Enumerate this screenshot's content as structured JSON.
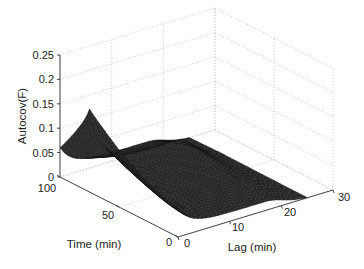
{
  "chart_data": {
    "type": "surface3d",
    "title": "",
    "xlabel": "Lag (min)",
    "ylabel": "Time (min)",
    "zlabel": "Autocov(F)",
    "x_ticks": [
      0,
      10,
      20,
      30
    ],
    "y_ticks": [
      0,
      50,
      100
    ],
    "z_ticks": [
      0,
      0.05,
      0.1,
      0.15,
      0.2,
      0.25
    ],
    "z_tick_labels": [
      "0",
      "0.05",
      "0.1",
      "0.15",
      "0.2",
      "0.25"
    ],
    "xlim": [
      0,
      30
    ],
    "ylim": [
      0,
      100
    ],
    "zlim": [
      0,
      0.25
    ],
    "grid": true,
    "surface_extent": {
      "lag_max": 25,
      "time_min": 0,
      "time_max": 100
    },
    "surface_color": "#2b2b2b",
    "mesh_color": "#111111",
    "samples": {
      "lag": [
        0,
        5,
        10,
        15,
        20,
        25
      ],
      "time": [
        0,
        25,
        50,
        75,
        100
      ],
      "autocov_at_lag0": [
        0.06,
        0.09,
        0.12,
        0.17,
        0.07
      ],
      "autocov_at_time0": [
        0.06,
        0.055,
        0.05,
        0.045,
        0.03,
        0.0
      ]
    }
  },
  "labels": {
    "zlabel": "Autocov(F)",
    "xlabel": "Lag (min)",
    "ylabel": "Time (min)",
    "z_ticks": [
      "0",
      "0.05",
      "0.1",
      "0.15",
      "0.2",
      "0.25"
    ],
    "y_ticks": [
      "100",
      "50",
      "0"
    ],
    "x_ticks": [
      "0",
      "10",
      "20",
      "30"
    ]
  }
}
